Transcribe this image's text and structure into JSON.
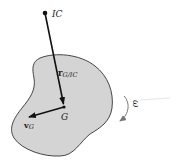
{
  "diagram": {
    "type": "rigid-body-kinematics",
    "body": {
      "fill": "#d4d4d4",
      "stroke": "#333333"
    },
    "points": {
      "ic": {
        "label": "IC",
        "x": 45,
        "y": 13
      },
      "g": {
        "label": "G",
        "x": 64,
        "y": 107
      }
    },
    "vectors": {
      "position": {
        "symbol": "r",
        "subscript": "G/IC"
      },
      "velocity": {
        "symbol": "v",
        "subscript": "G"
      }
    },
    "angular_velocity": {
      "symbol": "ω",
      "direction": "clockwise"
    }
  }
}
